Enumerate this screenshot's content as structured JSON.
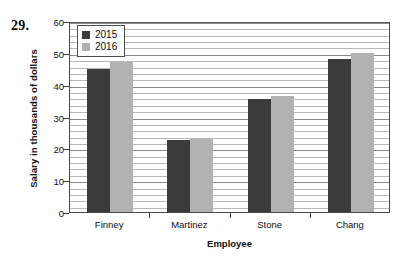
{
  "question_number": "29.",
  "chart_data": {
    "type": "bar",
    "title": "",
    "xlabel": "Employee",
    "ylabel": "Salary in thousands of dollars",
    "categories": [
      "Finney",
      "Martinez",
      "Stone",
      "Chang"
    ],
    "series": [
      {
        "name": "2015",
        "color": "#3b3b3b",
        "values": [
          45,
          22.5,
          35.5,
          48
        ]
      },
      {
        "name": "2016",
        "color": "#b2b2b2",
        "values": [
          47,
          23,
          36.5,
          50
        ]
      }
    ],
    "ylim": [
      0,
      60
    ],
    "ytick_labels": [
      "0",
      "10",
      "20",
      "30",
      "40",
      "50",
      "60"
    ],
    "ytick_values": [
      0,
      10,
      20,
      30,
      40,
      50,
      60
    ],
    "minor_tick_step": 2,
    "grid": true,
    "legend_position": "top-left",
    "legend_entries": [
      "2015",
      "2016"
    ]
  }
}
